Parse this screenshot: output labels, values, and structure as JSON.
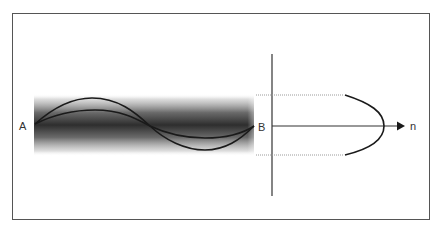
{
  "diagram": {
    "labels": {
      "point_a": "A",
      "point_b": "B",
      "axis_n": "n"
    },
    "colors": {
      "frame": "#555555",
      "line": "#222222",
      "band_dark": "#2a2a2a",
      "dotted": "#999999",
      "text": "#333333"
    },
    "elements": {
      "shaded_band": "Gaussian-like beam/fiber intensity band between A and B",
      "waves": [
        "higher-order mode wave",
        "lower-order mode wave"
      ],
      "axis": "horizontal axis with arrow to n",
      "vertical_line": "transverse reference line at B",
      "profile_curve": "parabolic refractive-index profile n(r)",
      "dotted_guides": [
        "upper core boundary",
        "lower core boundary"
      ]
    }
  }
}
